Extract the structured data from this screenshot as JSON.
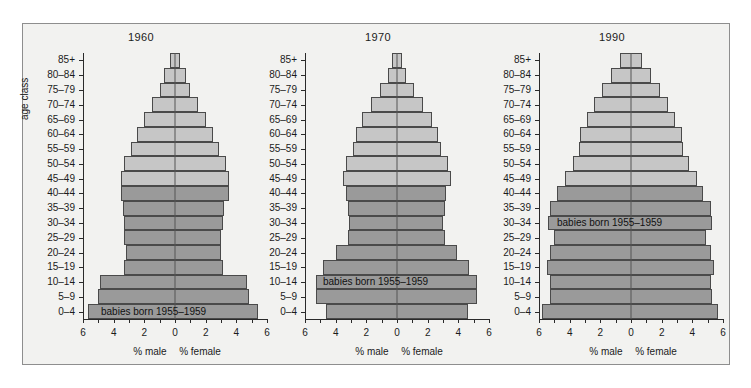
{
  "figure": {
    "y_axis_label": "age class",
    "age_classes": [
      "85+",
      "80–84",
      "75–79",
      "70–74",
      "65–69",
      "60–64",
      "55–59",
      "50–54",
      "45–49",
      "40–44",
      "35–39",
      "30–34",
      "25–29",
      "20–24",
      "15–19",
      "10–14",
      "5–9",
      "0–4"
    ],
    "x_ticks": [
      "6",
      "4",
      "2",
      "0",
      "2",
      "4",
      "6"
    ],
    "x_caption_male": "% male",
    "x_caption_female": "% female",
    "cohort_note": "babies born 1955–1959",
    "colors": {
      "light_fill": "#c6c6c6",
      "dark_fill": "#9a9a9a",
      "outline": "#4a4a4a",
      "frame": "#8e8e8e",
      "background": "#f2f2f0"
    }
  },
  "chart_data": [
    {
      "type": "bar",
      "title": "1960",
      "orientation": "population-pyramid",
      "xlabel": "% male / % female",
      "ylabel": "age class",
      "xlim": [
        6,
        6
      ],
      "grid": false,
      "categories": [
        "85+",
        "80–84",
        "75–79",
        "70–74",
        "65–69",
        "60–64",
        "55–59",
        "50–54",
        "45–49",
        "40–44",
        "35–39",
        "30–34",
        "25–29",
        "20–24",
        "15–19",
        "10–14",
        "5–9",
        "0–4"
      ],
      "series": [
        {
          "name": "% male",
          "values": [
            0.35,
            0.7,
            1.0,
            1.5,
            2.0,
            2.5,
            2.9,
            3.3,
            3.5,
            3.5,
            3.4,
            3.3,
            3.3,
            3.2,
            3.3,
            4.9,
            5.0,
            5.7
          ]
        },
        {
          "name": "% female",
          "values": [
            0.35,
            0.7,
            1.0,
            1.5,
            2.0,
            2.5,
            2.9,
            3.3,
            3.5,
            3.5,
            3.2,
            3.1,
            3.0,
            3.0,
            3.1,
            4.7,
            4.8,
            5.4
          ]
        }
      ],
      "cohort_band": {
        "label": "babies born 1955–1959",
        "from_age_class": "40–44",
        "to_age_class": "0–4",
        "highlight_rows": 9,
        "note_row": "0–4"
      }
    },
    {
      "type": "bar",
      "title": "1970",
      "orientation": "population-pyramid",
      "xlabel": "% male / % female",
      "ylabel": "age class",
      "xlim": [
        6,
        6
      ],
      "grid": false,
      "categories": [
        "85+",
        "80–84",
        "75–79",
        "70–74",
        "65–69",
        "60–64",
        "55–59",
        "50–54",
        "45–49",
        "40–44",
        "35–39",
        "30–34",
        "25–29",
        "20–24",
        "15–19",
        "10–14",
        "5–9",
        "0–4"
      ],
      "series": [
        {
          "name": "% male",
          "values": [
            0.3,
            0.6,
            1.1,
            1.7,
            2.3,
            2.7,
            2.9,
            3.3,
            3.5,
            3.3,
            3.2,
            3.1,
            3.2,
            4.0,
            4.8,
            5.3,
            5.3,
            4.6
          ]
        },
        {
          "name": "% female",
          "values": [
            0.3,
            0.6,
            1.1,
            1.7,
            2.3,
            2.7,
            2.9,
            3.3,
            3.5,
            3.2,
            3.1,
            3.0,
            3.1,
            3.9,
            4.7,
            5.2,
            5.2,
            4.6
          ]
        }
      ],
      "cohort_band": {
        "label": "babies born 1955–1959",
        "from_age_class": "40–44",
        "to_age_class": "0–4",
        "highlight_rows": 9,
        "note_row": "10–14"
      }
    },
    {
      "type": "bar",
      "title": "1990",
      "orientation": "population-pyramid",
      "xlabel": "% male / % female",
      "ylabel": "age class",
      "xlim": [
        6,
        6
      ],
      "grid": false,
      "categories": [
        "85+",
        "80–84",
        "75–79",
        "70–74",
        "65–69",
        "60–64",
        "55–59",
        "50–54",
        "45–49",
        "40–44",
        "35–39",
        "30–34",
        "25–29",
        "20–24",
        "15–19",
        "10–14",
        "5–9",
        "0–4"
      ],
      "series": [
        {
          "name": "% male",
          "values": [
            0.7,
            1.3,
            1.9,
            2.4,
            2.9,
            3.3,
            3.4,
            3.8,
            4.3,
            4.8,
            5.3,
            5.4,
            5.0,
            5.3,
            5.5,
            5.3,
            5.3,
            5.8
          ]
        },
        {
          "name": "% female",
          "values": [
            0.7,
            1.3,
            1.9,
            2.4,
            2.9,
            3.3,
            3.4,
            3.8,
            4.3,
            4.7,
            5.2,
            5.3,
            4.9,
            5.2,
            5.4,
            5.2,
            5.3,
            5.7
          ]
        }
      ],
      "cohort_band": {
        "label": "babies born 1955–1959",
        "from_age_class": "40–44",
        "to_age_class": "0–4",
        "highlight_rows": 9,
        "note_row": "30–34"
      }
    }
  ]
}
